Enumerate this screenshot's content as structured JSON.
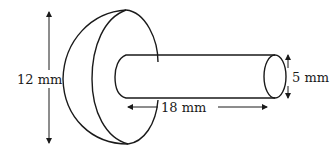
{
  "diagram": {
    "type": "3d-shape-dimension-drawing",
    "stroke_color": "#1a1a1a",
    "background": "#ffffff",
    "dimensions": {
      "hemisphere_diameter": {
        "label": "12 mm",
        "value": 12,
        "unit": "mm"
      },
      "cylinder_length": {
        "label": "18 mm",
        "value": 18,
        "unit": "mm"
      },
      "cylinder_diameter": {
        "label": "5 mm",
        "value": 5,
        "unit": "mm"
      }
    }
  }
}
